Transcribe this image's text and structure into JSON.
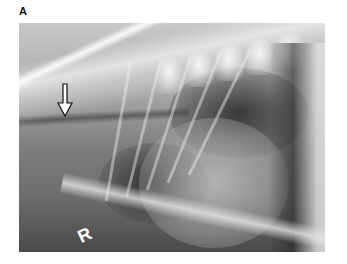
{
  "figure": {
    "panel_label": "A",
    "image": {
      "type": "radiograph",
      "description": "Lateral thoracic radiograph",
      "annotation": {
        "type": "arrow",
        "direction": "down",
        "icon": "arrow-down-icon"
      },
      "marker_text": "R"
    }
  }
}
